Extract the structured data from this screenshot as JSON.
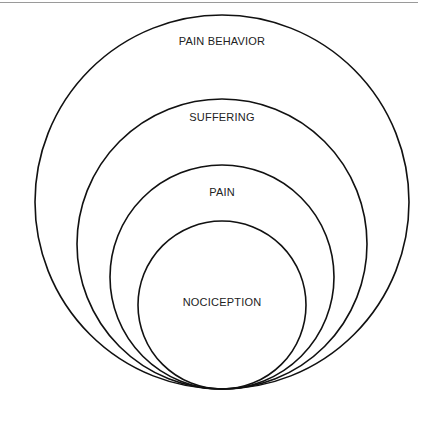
{
  "diagram": {
    "type": "nested-circles",
    "layers": [
      {
        "label": "PAIN BEHAVIOR",
        "level": 4
      },
      {
        "label": "SUFFERING",
        "level": 3
      },
      {
        "label": "PAIN",
        "level": 2
      },
      {
        "label": "NOCICEPTION",
        "level": 1
      }
    ]
  }
}
